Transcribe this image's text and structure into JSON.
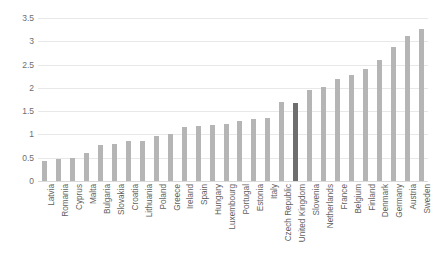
{
  "chart_data": {
    "type": "bar",
    "title": "",
    "subtitle": "",
    "xlabel": "",
    "ylabel": "",
    "ylim": [
      0,
      3.5
    ],
    "grid": true,
    "legend": "none",
    "y_ticks": [
      "0",
      "0.5",
      "1",
      "1.5",
      "2",
      "2.5",
      "3",
      "3.5"
    ],
    "y_tick_values": [
      0,
      0.5,
      1,
      1.5,
      2,
      2.5,
      3,
      3.5
    ],
    "highlight_category": "United Kingdom",
    "bar_color": "#b5b5b5",
    "highlight_color": "#6e6e6e",
    "grid_color": "#e8e8e8",
    "categories": [
      "Latvia",
      "Romania",
      "Cyprus",
      "Malta",
      "Bulgaria",
      "Slovakia",
      "Croatia",
      "Lithuania",
      "Poland",
      "Greece",
      "Ireland",
      "Spain",
      "Hungary",
      "Luxembourg",
      "Portugal",
      "Estonia",
      "Italy",
      "Czech Republic",
      "United Kingdom",
      "Slovenia",
      "Netherlands",
      "France",
      "Belgium",
      "Finland",
      "Denmark",
      "Germany",
      "Austria",
      "Sweden"
    ],
    "values": [
      0.44,
      0.47,
      0.49,
      0.61,
      0.78,
      0.79,
      0.85,
      0.86,
      0.97,
      1.01,
      1.17,
      1.18,
      1.2,
      1.23,
      1.28,
      1.33,
      1.35,
      1.7,
      1.68,
      1.95,
      2.01,
      2.18,
      2.28,
      2.41,
      2.6,
      2.88,
      3.11,
      3.27
    ]
  }
}
